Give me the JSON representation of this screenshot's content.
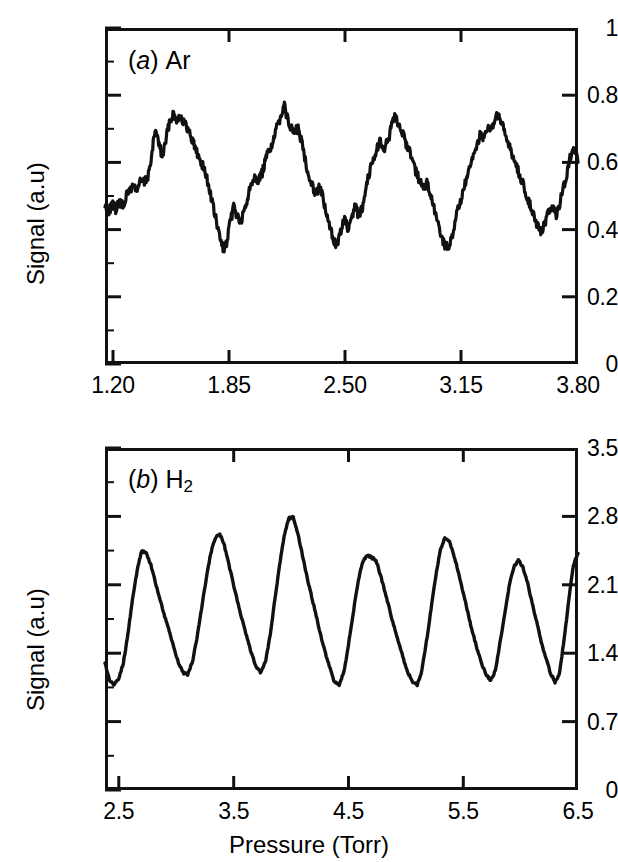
{
  "figure": {
    "background": "#ffffff",
    "ink_color": "#111111",
    "panels": [
      "a",
      "b"
    ]
  },
  "panel_a": {
    "tag_letter": "a",
    "tag_species": "Ar",
    "ylabel": "Signal (a.u)",
    "yticks": [
      "0",
      "0.2",
      "0.4",
      "0.6",
      "0.8",
      "1"
    ],
    "xticks": [
      "1.20",
      "1.85",
      "2.50",
      "3.15",
      "3.80"
    ]
  },
  "panel_b": {
    "tag_letter": "b",
    "tag_species_main": "H",
    "tag_species_sub": "2",
    "ylabel": "Signal (a.u)",
    "yticks": [
      "0",
      "0.7",
      "1.4",
      "2.1",
      "2.8",
      "3.5"
    ],
    "xticks": [
      "2.5",
      "3.5",
      "4.5",
      "5.5",
      "6.5"
    ],
    "xlabel": "Pressure  (Torr)"
  },
  "chart_data": [
    {
      "type": "line",
      "id": "panel-a-ar",
      "title": "(a) Ar",
      "xlabel": "",
      "ylabel": "Signal (a.u)",
      "xlim": [
        1.155,
        3.8
      ],
      "ylim": [
        0,
        1
      ],
      "xticks": [
        1.2,
        1.85,
        2.5,
        3.15,
        3.8
      ],
      "yticks": [
        0,
        0.2,
        0.4,
        0.6,
        0.8,
        1.0
      ],
      "minor_ticks": true,
      "grid": false,
      "legend": null,
      "series_name": "Ar signal",
      "description": "Noisy quasi-periodic oscillation, ~7 maxima, mean ~0.55, peaks 0.66-0.78, troughs 0.34-0.44",
      "x": [
        1.155,
        1.175,
        1.195,
        1.215,
        1.235,
        1.255,
        1.275,
        1.295,
        1.315,
        1.335,
        1.355,
        1.375,
        1.395,
        1.415,
        1.435,
        1.455,
        1.475,
        1.495,
        1.515,
        1.535,
        1.555,
        1.575,
        1.595,
        1.615,
        1.635,
        1.655,
        1.675,
        1.695,
        1.715,
        1.735,
        1.755,
        1.775,
        1.795,
        1.815,
        1.835,
        1.855,
        1.875,
        1.895,
        1.915,
        1.935,
        1.955,
        1.975,
        1.995,
        2.015,
        2.035,
        2.055,
        2.075,
        2.095,
        2.115,
        2.135,
        2.155,
        2.175,
        2.195,
        2.215,
        2.235,
        2.255,
        2.275,
        2.295,
        2.315,
        2.335,
        2.355,
        2.375,
        2.395,
        2.415,
        2.435,
        2.455,
        2.475,
        2.495,
        2.515,
        2.535,
        2.555,
        2.575,
        2.595,
        2.615,
        2.635,
        2.655,
        2.675,
        2.695,
        2.715,
        2.735,
        2.755,
        2.775,
        2.795,
        2.815,
        2.835,
        2.855,
        2.875,
        2.895,
        2.915,
        2.935,
        2.955,
        2.975,
        2.995,
        3.015,
        3.035,
        3.055,
        3.075,
        3.095,
        3.115,
        3.135,
        3.155,
        3.175,
        3.195,
        3.215,
        3.235,
        3.255,
        3.275,
        3.295,
        3.315,
        3.335,
        3.355,
        3.375,
        3.395,
        3.415,
        3.435,
        3.455,
        3.475,
        3.495,
        3.515,
        3.535,
        3.555,
        3.575,
        3.595,
        3.615,
        3.635,
        3.655,
        3.675,
        3.695,
        3.715,
        3.735,
        3.755,
        3.775,
        3.8
      ],
      "y": [
        0.47,
        0.455,
        0.475,
        0.46,
        0.48,
        0.47,
        0.5,
        0.52,
        0.53,
        0.52,
        0.545,
        0.54,
        0.56,
        0.61,
        0.7,
        0.66,
        0.615,
        0.665,
        0.72,
        0.745,
        0.73,
        0.74,
        0.72,
        0.7,
        0.68,
        0.65,
        0.62,
        0.6,
        0.57,
        0.53,
        0.48,
        0.43,
        0.38,
        0.345,
        0.355,
        0.42,
        0.47,
        0.44,
        0.42,
        0.455,
        0.5,
        0.545,
        0.56,
        0.545,
        0.57,
        0.61,
        0.64,
        0.66,
        0.7,
        0.735,
        0.775,
        0.73,
        0.7,
        0.69,
        0.7,
        0.66,
        0.61,
        0.56,
        0.53,
        0.51,
        0.53,
        0.49,
        0.44,
        0.4,
        0.37,
        0.35,
        0.4,
        0.43,
        0.4,
        0.425,
        0.47,
        0.44,
        0.47,
        0.53,
        0.575,
        0.61,
        0.64,
        0.665,
        0.64,
        0.66,
        0.7,
        0.735,
        0.72,
        0.69,
        0.66,
        0.64,
        0.61,
        0.57,
        0.545,
        0.52,
        0.54,
        0.5,
        0.46,
        0.42,
        0.385,
        0.35,
        0.345,
        0.38,
        0.43,
        0.47,
        0.51,
        0.545,
        0.58,
        0.615,
        0.65,
        0.69,
        0.665,
        0.71,
        0.69,
        0.73,
        0.74,
        0.71,
        0.68,
        0.65,
        0.62,
        0.59,
        0.56,
        0.53,
        0.5,
        0.47,
        0.44,
        0.41,
        0.39,
        0.42,
        0.45,
        0.47,
        0.44,
        0.47,
        0.52,
        0.56,
        0.61,
        0.65,
        0.6
      ]
    },
    {
      "type": "line",
      "id": "panel-b-h2",
      "title": "(b) H2",
      "xlabel": "Pressure  (Torr)",
      "ylabel": "Signal (a.u)",
      "xlim": [
        2.38,
        6.5
      ],
      "ylim": [
        0,
        3.5
      ],
      "xticks": [
        2.5,
        3.5,
        4.5,
        5.5,
        6.5
      ],
      "yticks": [
        0,
        0.7,
        1.4,
        2.1,
        2.8,
        3.5
      ],
      "minor_ticks": true,
      "grid": false,
      "legend": null,
      "series_name": "H2 signal",
      "description": "Smooth quasi-sinusoidal/sawtooth oscillation, 8 maxima, peaks 2.4-2.8, troughs 0.95-1.25",
      "x": [
        2.38,
        2.42,
        2.46,
        2.5,
        2.54,
        2.58,
        2.62,
        2.66,
        2.7,
        2.74,
        2.78,
        2.82,
        2.86,
        2.9,
        2.94,
        2.98,
        3.02,
        3.06,
        3.1,
        3.14,
        3.18,
        3.22,
        3.26,
        3.3,
        3.34,
        3.38,
        3.42,
        3.46,
        3.5,
        3.54,
        3.58,
        3.62,
        3.66,
        3.7,
        3.74,
        3.78,
        3.82,
        3.86,
        3.9,
        3.94,
        3.98,
        4.02,
        4.06,
        4.1,
        4.14,
        4.18,
        4.22,
        4.26,
        4.3,
        4.34,
        4.38,
        4.42,
        4.46,
        4.5,
        4.54,
        4.58,
        4.62,
        4.66,
        4.7,
        4.74,
        4.78,
        4.82,
        4.86,
        4.9,
        4.94,
        4.98,
        5.02,
        5.06,
        5.1,
        5.14,
        5.18,
        5.22,
        5.26,
        5.3,
        5.34,
        5.38,
        5.42,
        5.46,
        5.5,
        5.54,
        5.58,
        5.62,
        5.66,
        5.7,
        5.74,
        5.78,
        5.82,
        5.86,
        5.9,
        5.94,
        5.98,
        6.02,
        6.06,
        6.1,
        6.14,
        6.18,
        6.22,
        6.26,
        6.3,
        6.34,
        6.38,
        6.42,
        6.46,
        6.5
      ],
      "y": [
        1.3,
        1.12,
        1.08,
        1.14,
        1.3,
        1.6,
        1.95,
        2.25,
        2.45,
        2.42,
        2.3,
        2.12,
        1.95,
        1.78,
        1.62,
        1.45,
        1.3,
        1.2,
        1.18,
        1.3,
        1.55,
        1.85,
        2.15,
        2.42,
        2.58,
        2.62,
        2.5,
        2.3,
        2.1,
        1.9,
        1.72,
        1.55,
        1.38,
        1.25,
        1.2,
        1.32,
        1.6,
        1.95,
        2.3,
        2.6,
        2.78,
        2.79,
        2.62,
        2.4,
        2.18,
        1.98,
        1.78,
        1.58,
        1.4,
        1.25,
        1.1,
        1.08,
        1.2,
        1.48,
        1.8,
        2.1,
        2.32,
        2.4,
        2.38,
        2.35,
        2.2,
        2.02,
        1.84,
        1.66,
        1.5,
        1.34,
        1.2,
        1.1,
        1.08,
        1.22,
        1.52,
        1.85,
        2.18,
        2.45,
        2.58,
        2.55,
        2.4,
        2.22,
        2.02,
        1.82,
        1.62,
        1.45,
        1.3,
        1.18,
        1.12,
        1.22,
        1.5,
        1.8,
        2.08,
        2.28,
        2.35,
        2.28,
        2.12,
        1.92,
        1.72,
        1.52,
        1.35,
        1.2,
        1.1,
        1.2,
        1.55,
        1.95,
        2.3,
        2.42
      ]
    }
  ]
}
